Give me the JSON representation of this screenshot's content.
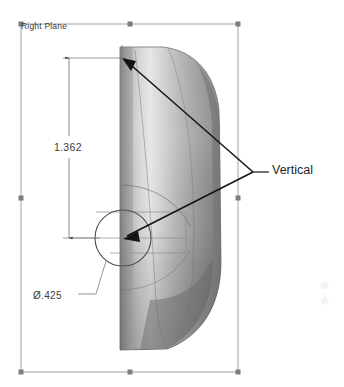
{
  "viewport": {
    "width": 344,
    "height": 387,
    "background": "#ffffff"
  },
  "plane": {
    "label": "Right Plane",
    "border_color": "#9a9a9a",
    "handle_color": "#7d7d7d",
    "bounds": {
      "left": 21,
      "top": 24,
      "right": 238,
      "bottom": 372
    },
    "handles": [
      {
        "name": "handle-top-left",
        "x": 21,
        "y": 24
      },
      {
        "name": "handle-top-center",
        "x": 130,
        "y": 24
      },
      {
        "name": "handle-top-right",
        "x": 238,
        "y": 24
      },
      {
        "name": "handle-middle-left",
        "x": 21,
        "y": 198
      },
      {
        "name": "handle-middle-right",
        "x": 238,
        "y": 198
      },
      {
        "name": "handle-bottom-left",
        "x": 21,
        "y": 372
      },
      {
        "name": "handle-bottom-center",
        "x": 130,
        "y": 372
      },
      {
        "name": "handle-bottom-right",
        "x": 238,
        "y": 372
      }
    ]
  },
  "dimensions": [
    {
      "name": "linear-dimension",
      "type": "linear",
      "value": "1.362",
      "units": "in",
      "orientation": "vertical",
      "witness_top_y": 58,
      "witness_bottom_y": 238,
      "dim_line_x": 69,
      "color": "#3c3c3c"
    },
    {
      "name": "diameter-dimension",
      "type": "diameter",
      "value": "Ø.425",
      "symbol": "Ø",
      "number": ".425",
      "color": "#3c3c3c"
    }
  ],
  "relations": [
    {
      "name": "relation-vertical",
      "label": "Vertical",
      "targets": 2,
      "leader_junction": {
        "x": 253,
        "y": 172
      },
      "arrow_points": [
        {
          "x": 122,
          "y": 58
        },
        {
          "x": 124,
          "y": 238
        }
      ],
      "color": "#141414"
    }
  ],
  "sketch_geometry": {
    "circle": {
      "name": "sketch-circle",
      "cx": 123,
      "cy": 238,
      "r": 28,
      "color": "#5a5a5a"
    },
    "construction_color": "#8c8c8c",
    "spline_color": "#6e6e6e"
  },
  "model": {
    "name": "shaded-solid-body",
    "description": "revolved half-capsule solid, shaded grey",
    "light_color": "#e9e9e9",
    "mid_color": "#b4b4b4",
    "dark_color": "#6f6f6f",
    "darkest_color": "#555555",
    "silhouette_color": "#4d4d4d"
  },
  "watermark": {
    "name": "faint-watermark",
    "x": 322,
    "y": 292,
    "opacity": 0.06
  }
}
